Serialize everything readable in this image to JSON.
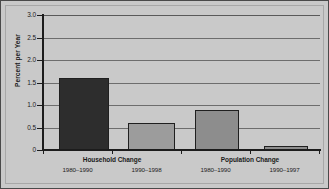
{
  "chart_data": {
    "type": "bar",
    "title": "",
    "subtitle": "",
    "xlabel": "",
    "ylabel": "Percent per Year",
    "ylim": [
      0,
      3.0
    ],
    "ytick_values": [
      3.0,
      2.5,
      2.0,
      1.5,
      1.0,
      0.5,
      0
    ],
    "ytick_labels": [
      "3.0",
      "2.5",
      "2.0",
      "1.5",
      "1.0",
      "0.5",
      "0"
    ],
    "grid": true,
    "grid_axis": "y",
    "legend": false,
    "legend_position": "none",
    "categories": [
      "1980–1990",
      "1990–1998",
      "1980–1990",
      "1990–1997"
    ],
    "values": [
      1.6,
      0.6,
      0.9,
      0.1
    ],
    "bar_colors": [
      "#2d2d2d",
      "#9c9c9c",
      "#8d8d8d",
      "#8d8d8d"
    ],
    "bar_edge_color": "#1f1f1f",
    "groups": [
      {
        "label": "Household Change",
        "periods": [
          "1980–1990",
          "1990–1998"
        ],
        "values": [
          1.6,
          0.6
        ]
      },
      {
        "label": "Population Change",
        "periods": [
          "1980–1990",
          "1990–1997"
        ],
        "values": [
          0.9,
          0.1
        ]
      }
    ],
    "series": [
      {
        "name": "Percent per Year",
        "values": [
          1.6,
          0.6,
          0.9,
          0.1
        ]
      }
    ]
  },
  "axis": {
    "y_title": "Percent per Year",
    "ticks": {
      "t0": "3.0",
      "t1": "2.5",
      "t2": "2.0",
      "t3": "1.5",
      "t4": "1.0",
      "t5": "0.5",
      "t6": "0"
    }
  },
  "groups": {
    "household": {
      "label": "Household Change",
      "period_a": "1980–1990",
      "period_b": "1990–1998"
    },
    "population": {
      "label": "Population Change",
      "period_a": "1980–1990",
      "period_b": "1990–1997"
    }
  },
  "colors": {
    "figure_background": "#c9c9c9",
    "plot_background": "#c9c9c9",
    "gridline": "#6d6d6d",
    "axis": "#1c1c1c",
    "text": "#1b1b1b",
    "bar_dark": "#2d2d2d",
    "bar_light": "#9c9c9c",
    "bar_medium": "#8d8d8d",
    "border": "#4a4a4a"
  }
}
